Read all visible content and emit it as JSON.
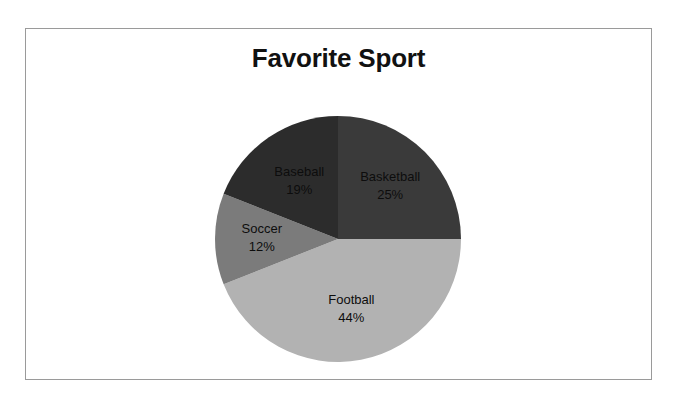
{
  "chart_data": {
    "type": "pie",
    "title": "Favorite Sport",
    "xlabel": "",
    "ylabel": "",
    "legend": "none",
    "grid": false,
    "start_angle_deg": 0,
    "direction": "clockwise",
    "units": "percent",
    "categories": [
      "Basketball",
      "Football",
      "Soccer",
      "Baseball"
    ],
    "values": [
      25,
      44,
      12,
      19
    ],
    "labels_inside": true,
    "slices": [
      {
        "name": "Basketball",
        "value": 25,
        "label": "Basketball",
        "value_label": "25%",
        "color": "#3a3a3a",
        "label_color": "#0d0d0d"
      },
      {
        "name": "Football",
        "value": 44,
        "label": "Football",
        "value_label": "44%",
        "color": "#b2b2b2",
        "label_color": "#0d0d0d"
      },
      {
        "name": "Soccer",
        "value": 12,
        "label": "Soccer",
        "value_label": "12%",
        "color": "#7b7b7b",
        "label_color": "#0d0d0d"
      },
      {
        "name": "Baseball",
        "value": 19,
        "label": "Baseball",
        "value_label": "19%",
        "color": "#2c2c2c",
        "label_color": "#0d0d0d"
      }
    ]
  },
  "frame": {
    "border_color": "#9a9a9a",
    "background": "#ffffff"
  }
}
